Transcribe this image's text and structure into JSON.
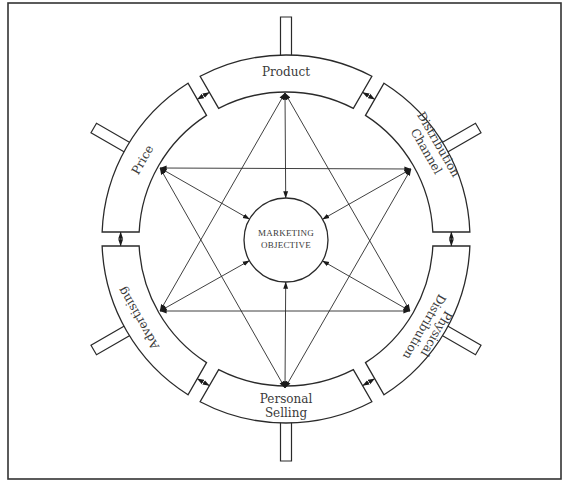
{
  "diagram": {
    "colors": {
      "stroke": "#2a2a2a",
      "text": "#3a3a3a",
      "background": "#ffffff",
      "frame": "#333333"
    },
    "frame": {
      "x": 8,
      "y": 3,
      "width": 553,
      "height": 476
    },
    "wheel": {
      "cx": 286,
      "cy": 239,
      "outer_r": 184,
      "inner_r": 147,
      "gap": 14,
      "stub_length": 38,
      "stub_width": 11
    },
    "core": {
      "cx": 286,
      "cy": 240,
      "r": 42,
      "label_line1": "MARKETING",
      "label_line2": "OBJECTIVE"
    },
    "segments": [
      {
        "id": "product",
        "angle": 0,
        "lines": [
          "Product"
        ],
        "label_x": 286,
        "label_y": 72,
        "rotate": 0
      },
      {
        "id": "distribution-channel",
        "angle": 60,
        "lines": [
          "Distribution",
          "Channel"
        ],
        "label_x": 432,
        "label_y": 148,
        "rotate": 60
      },
      {
        "id": "physical-distribution",
        "angle": 120,
        "lines": [
          "Physical",
          "Distribution"
        ],
        "label_x": 430,
        "label_y": 330,
        "rotate": 120
      },
      {
        "id": "personal-selling",
        "angle": 180,
        "lines": [
          "Personal",
          "Selling"
        ],
        "label_x": 286,
        "label_y": 406,
        "rotate": 0
      },
      {
        "id": "advertising",
        "angle": 240,
        "lines": [
          "Advertising"
        ],
        "label_x": 139,
        "label_y": 318,
        "rotate": 240
      },
      {
        "id": "price",
        "angle": 300,
        "lines": [
          "Price"
        ],
        "label_x": 143,
        "label_y": 160,
        "rotate": -60
      }
    ],
    "connections": {
      "vertices": {
        "top": [
          285,
          93
        ],
        "upper_right": [
          411,
          169
        ],
        "lower_right": [
          410,
          311
        ],
        "bottom": [
          285,
          388
        ],
        "lower_left": [
          160,
          311
        ],
        "upper_left": [
          160,
          168
        ]
      },
      "star_edges": [
        [
          "top",
          "lower_left"
        ],
        [
          "top",
          "lower_right"
        ],
        [
          "lower_left",
          "lower_right"
        ],
        [
          "bottom",
          "upper_left"
        ],
        [
          "bottom",
          "upper_right"
        ],
        [
          "upper_left",
          "upper_right"
        ]
      ],
      "spokes": [
        "top",
        "upper_right",
        "lower_right",
        "bottom",
        "lower_left",
        "upper_left"
      ]
    }
  }
}
